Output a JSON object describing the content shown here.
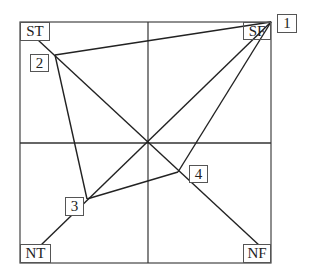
{
  "diagram": {
    "type": "quadrant-path-diagram",
    "frame": {
      "x1": 20,
      "y1": 22,
      "x2": 271,
      "y2": 263
    },
    "axes": {
      "vertical_x": 148,
      "horizontal_y": 143
    },
    "colors": {
      "line": "#222222",
      "frame": "#444444",
      "background": "#ffffff"
    },
    "corner_labels": [
      {
        "id": "st",
        "text": "ST",
        "position": "top-left"
      },
      {
        "id": "sf",
        "text": "SF",
        "position": "top-right"
      },
      {
        "id": "nt",
        "text": "NT",
        "position": "bottom-left"
      },
      {
        "id": "nf",
        "text": "NF",
        "position": "bottom-right"
      }
    ],
    "points": [
      {
        "id": "1",
        "label": "1",
        "x": 271,
        "y": 22
      },
      {
        "id": "2",
        "label": "2",
        "x": 55,
        "y": 55
      },
      {
        "id": "3",
        "label": "3",
        "x": 87,
        "y": 199
      },
      {
        "id": "4",
        "label": "4",
        "x": 178,
        "y": 172
      }
    ],
    "path_order": [
      "1",
      "2",
      "3",
      "4",
      "1"
    ],
    "diagonals": [
      {
        "from": "top-left",
        "to": "bottom-right"
      },
      {
        "from": "top-right",
        "to": "bottom-left"
      }
    ]
  }
}
